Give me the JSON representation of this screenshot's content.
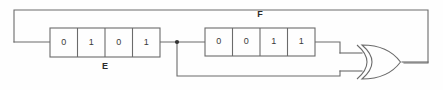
{
  "diagram": {
    "type": "linear-feedback-shift-register",
    "stroke_color": "#6b6b6b",
    "text_color": "#3a3a3a",
    "background": "#fefefe"
  },
  "registers": [
    {
      "name": "E",
      "label": "E",
      "label_position": "below",
      "cells": [
        "0",
        "1",
        "0",
        "1"
      ],
      "x": 50,
      "y": 28,
      "width": 110,
      "height": 29
    },
    {
      "name": "F",
      "label": "F",
      "label_position": "above",
      "cells": [
        "0",
        "0",
        "1",
        "1"
      ],
      "x": 205,
      "y": 28,
      "width": 110,
      "height": 28
    }
  ],
  "gate": {
    "name": "xor-gate",
    "type": "XOR",
    "label": "",
    "x": 358,
    "y": 45,
    "width": 44,
    "height": 35
  },
  "junction": {
    "name": "wire-junction",
    "x": 177,
    "y": 42
  },
  "wires": [
    {
      "name": "feedback-top-wire",
      "path": "M 14 42 L 14 10 L 428 10 L 428 63 L 404 63"
    },
    {
      "name": "feedback-into-register-e",
      "path": "M 14 42 L 50 42"
    },
    {
      "name": "register-e-to-junction",
      "path": "M 160 42 L 205 42"
    },
    {
      "name": "junction-down-wire",
      "path": "M 177 42 L 177 76 L 340 76 L 340 71"
    },
    {
      "name": "register-f-to-gate",
      "path": "M 315 42 L 340 42 L 340 53"
    },
    {
      "name": "gate-upper-input-stub",
      "path": "M 340 53 L 362 53"
    },
    {
      "name": "gate-lower-input-stub",
      "path": "M 340 71 L 362 71"
    },
    {
      "name": "gate-output-wire",
      "path": "M 402 62 L 428 62"
    }
  ]
}
